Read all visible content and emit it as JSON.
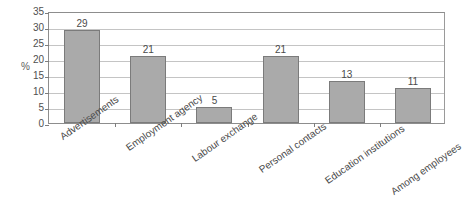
{
  "chart_data": {
    "type": "bar",
    "title": "",
    "subtitle": "",
    "xlabel": "",
    "ylabel": "%",
    "categories": [
      "Advertisements",
      "Employment agency",
      "Labour exchange",
      "Personal contacts",
      "Education institutions",
      "Among employees"
    ],
    "values": [
      29,
      21,
      5,
      21,
      13,
      11
    ],
    "value_labels": [
      "29",
      "21",
      "5",
      "21",
      "13",
      "11"
    ],
    "ylim": [
      0,
      35
    ],
    "ytick_step": 5,
    "ytick_labels": [
      "0",
      "5",
      "10",
      "15",
      "20",
      "25",
      "30",
      "35"
    ],
    "grid": true,
    "grid_axis": "y",
    "legend": false,
    "legend_position": "none",
    "orientation": "vertical",
    "xtick_label_rotation": -35
  },
  "style": {
    "bar_fill": "#aaaaaa",
    "bar_border": "#7b7b7b",
    "gridline_color": "#c4c4c4",
    "axis_color": "#8d8d8d",
    "text_color": "#4a4a4a",
    "background": "#ffffff"
  }
}
